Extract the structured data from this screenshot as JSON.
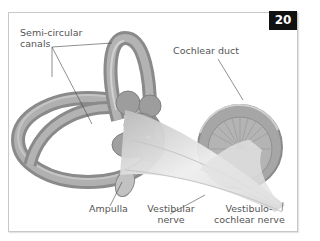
{
  "figure": {
    "number": "20"
  },
  "labels": {
    "semicircular_canals": [
      "Semi-circular",
      "canals"
    ],
    "cochlear_duct": "Cochlear duct",
    "ampulla": "Ampulla",
    "vestibular_nerve": [
      "Vestibular",
      "nerve"
    ],
    "vestibulocochlear_nerve": [
      "Vestibulo-",
      "cochlear nerve"
    ]
  },
  "colors": {
    "canal_fill": "#9a9a9a",
    "canal_highlight": "#c2c2c2",
    "cochlea_fill": "#a3a3a3",
    "nerve_fill": "#dcdcdc",
    "badge_bg": "#111111",
    "label_text": "#555555"
  }
}
